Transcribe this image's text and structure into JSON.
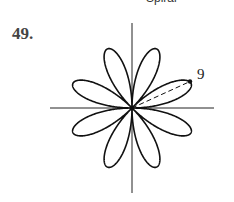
{
  "header": {
    "partial_caption": "Spiral"
  },
  "problem": {
    "number": "49."
  },
  "figure": {
    "type": "rose curve",
    "petals": 8,
    "tip_label": "9",
    "center": [
      132,
      108
    ],
    "radius_px": 64,
    "first_peak_deg": 22.5,
    "colors": {
      "stroke": "#111111",
      "axis": "#222222"
    }
  }
}
